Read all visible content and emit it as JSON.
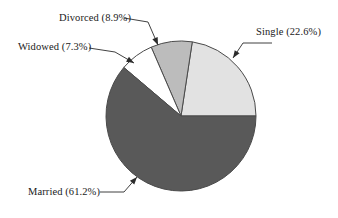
{
  "chart_data": {
    "type": "pie",
    "title": "",
    "subtitle": "",
    "xlabel": "",
    "ylabel": "",
    "legend_position": "none",
    "grid": false,
    "labels_inside": false,
    "start_angle_deg": 0,
    "direction": "counterclockwise",
    "categories": [
      "Single",
      "Divorced",
      "Widowed",
      "Married"
    ],
    "values": [
      22.6,
      8.9,
      7.3,
      61.2
    ],
    "value_unit": "percent",
    "slices": [
      {
        "name": "Single",
        "value": 22.6,
        "label": "Single (22.6%)",
        "color": "#e2e2e2",
        "edge_color": "#4a4a4a",
        "label_x": 256,
        "label_y": 26,
        "leader": "M 233 58 L 243 43 L 272 43",
        "arrow_at": [
          233,
          58
        ]
      },
      {
        "name": "Divorced",
        "value": 8.9,
        "label": "Divorced (8.9%)",
        "color": "#bcbcbc",
        "edge_color": "#4a4a4a",
        "label_x": 59,
        "label_y": 12,
        "leader": "M 158 45 L 148 22 L 124 18",
        "arrow_at": [
          158,
          45
        ]
      },
      {
        "name": "Widowed",
        "value": 7.3,
        "label": "Widowed (7.3%)",
        "color": "#ffffff",
        "edge_color": "#4a4a4a",
        "label_x": 18,
        "label_y": 41,
        "leader": "M 134 63 L 115 52 L 89 48",
        "arrow_at": [
          134,
          63
        ]
      },
      {
        "name": "Married",
        "value": 61.2,
        "label": "Married (61.2%)",
        "color": "#595959",
        "edge_color": "#4a4a4a",
        "label_x": 28,
        "label_y": 186,
        "leader": "M 137 177 L 124 192 L 100 192",
        "arrow_at": [
          137,
          177
        ]
      }
    ],
    "geometry": {
      "center_x": 181,
      "center_y": 116,
      "radius": 75
    },
    "colors": {
      "background": "#ffffff",
      "text": "#1a1a1a",
      "outline": "#4a4a4a",
      "leader_line": "#2b2b2b"
    }
  }
}
